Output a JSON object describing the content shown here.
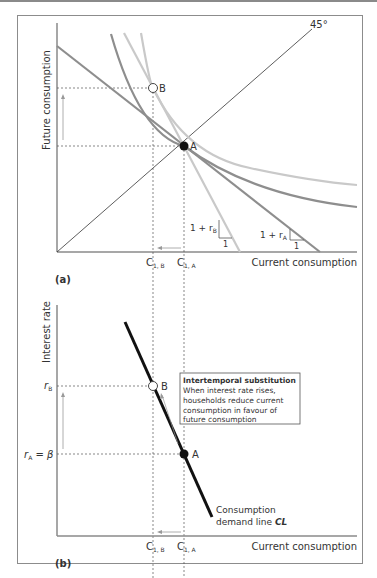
{
  "panel_a": {
    "tag": "(a)",
    "y_axis_label": "Future consumption",
    "x_axis_label": "Current consumption",
    "angle_label": "45°",
    "point_a": "A",
    "point_b": "B",
    "tick_c1b_main": "C",
    "tick_c1b_sub": "1, B",
    "tick_c1a_main": "C",
    "tick_c1a_sub": "1, A",
    "slope_b_prefix": "1 + r",
    "slope_b_sub": "B",
    "slope_a_prefix": "1 + r",
    "slope_a_sub": "A",
    "slope_run": "1"
  },
  "panel_b": {
    "tag": "(b)",
    "y_axis_label": "Interest rate",
    "x_axis_label": "Current consumption",
    "rb_main": "r",
    "rb_sub": "B",
    "ra_main": "r",
    "ra_sub": "A",
    "ra_eq": " = β",
    "point_a": "A",
    "point_b": "B",
    "tick_c1b_main": "C",
    "tick_c1b_sub": "1, B",
    "tick_c1a_main": "C",
    "tick_c1a_sub": "1, A",
    "callout_title": "Intertemporal substitution",
    "callout_lines": [
      "When interest rate rises,",
      "households reduce current",
      "consumption in favour of",
      "future consumption"
    ],
    "cl_line1": "Consumption",
    "cl_line2_prefix": "demand line ",
    "cl_line2_bold": "CL"
  },
  "colors": {
    "dark_curve": "#8e8e8e",
    "light_curve": "#c9c9c9",
    "axis": "#8a8a8a",
    "cl_line": "#111111"
  }
}
